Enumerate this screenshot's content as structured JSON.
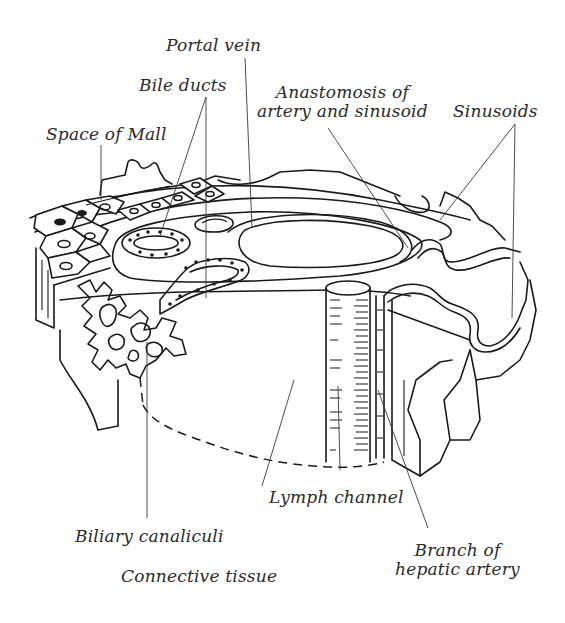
{
  "figure": {
    "type": "anatomical line drawing",
    "ink_color": "#1a1a1a",
    "background": "#ffffff"
  },
  "labels": {
    "portal_vein": "Portal vein",
    "bile_ducts": "Bile ducts",
    "space_of_mall": "Space of Mall",
    "anastomosis_line1": "Anastomosis of",
    "anastomosis_line2": "artery and sinusoid",
    "sinusoids": "Sinusoids",
    "lymph_channel": "Lymph channel",
    "biliary_canaliculi": "Biliary canaliculi",
    "connective_tissue": "Connective tissue",
    "branch_line1": "Branch of",
    "branch_line2": "hepatic artery"
  }
}
